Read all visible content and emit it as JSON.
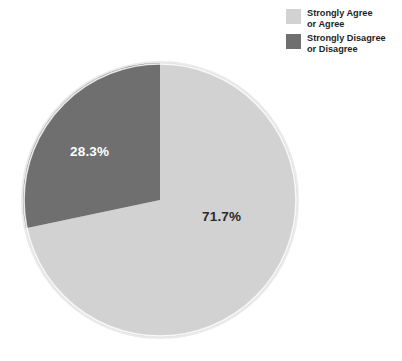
{
  "chart_data": {
    "type": "pie",
    "title": "",
    "subtitle": "",
    "xlabel": "",
    "ylabel": "",
    "legend_position": "top-right",
    "grid": false,
    "categories": [
      "Strongly Agree or Agree",
      "Strongly Disagree or Disagree"
    ],
    "values": [
      71.7,
      28.3
    ],
    "value_labels": [
      "71.7%",
      "28.3%"
    ],
    "units": "percent",
    "slices": [
      {
        "label": "Strongly Agree or Agree",
        "value": 71.7,
        "value_label": "71.7%",
        "color": "#d2d2d2",
        "start_angle_deg": 0,
        "end_angle_deg": 258.12
      },
      {
        "label": "Strongly Disagree or Disagree",
        "value": 28.3,
        "value_label": "28.3%",
        "color": "#6f6f6f",
        "start_angle_deg": 258.12,
        "end_angle_deg": 360
      }
    ]
  },
  "legend": {
    "items": [
      {
        "line1": "Strongly Agree",
        "line2": "or Agree",
        "swatch_color": "#d2d2d2",
        "swatch_name": "legend-swatch-agree"
      },
      {
        "line1": "Strongly Disagree",
        "line2": "or Disagree",
        "swatch_color": "#6f6f6f",
        "swatch_name": "legend-swatch-disagree"
      }
    ]
  },
  "pie": {
    "center_x": 160,
    "center_y": 200,
    "radius": 137,
    "ring_color": "#e9e9e9",
    "background": "#ffffff"
  },
  "labels": {
    "dark_slice": "28.3%",
    "light_slice": "71.7%"
  }
}
